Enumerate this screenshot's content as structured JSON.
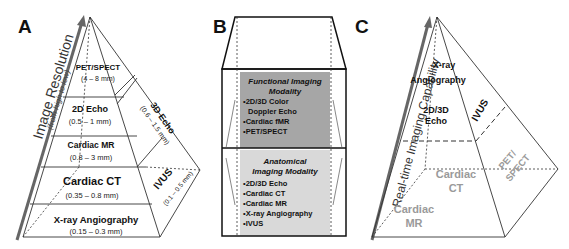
{
  "panels": {
    "a": {
      "letter": "A",
      "axis_label": "Image Resolution",
      "axis_sublabel": "(from high to low)",
      "tiers": [
        {
          "name": "PET/SPECT",
          "range": "(4 – 8 mm)"
        },
        {
          "name": "2D Echo",
          "range": "(0.5 – 1 mm)"
        },
        {
          "name": "Cardiac MR",
          "range": "(0.8 – 3 mm)"
        },
        {
          "name": "Cardiac CT",
          "range": "(0.35 – 0.8 mm)"
        },
        {
          "name": "X-ray Angiography",
          "range": "(0.15 – 0.3 mm)"
        }
      ],
      "side_tiers": [
        {
          "name": "3D Echo",
          "range": "(0.6 – 1.5 mm)"
        },
        {
          "name": "IVUS",
          "range": "(0.1 – 0.5 mm)"
        }
      ]
    },
    "b": {
      "letter": "B",
      "functional": {
        "title_line1": "Functional Imaging",
        "title_line2": "Modality",
        "items": [
          "•2D/3D Color",
          "Doppler Echo",
          "•Cardiac fMR",
          "•PET/SPECT"
        ]
      },
      "anatomical": {
        "title_line1": "Anatomical",
        "title_line2": "Imaging Modality",
        "items": [
          "•2D/3D Echo",
          "•Cardiac CT",
          "•Cardiac MR",
          "•X-ray Angiography",
          "•IVUS"
        ]
      }
    },
    "c": {
      "letter": "C",
      "axis_label": "Real-time Imaging Capability",
      "front_labels": {
        "xray_line1": "X-ray",
        "xray_line2": "Angiography",
        "echo_line1": "2D/3D",
        "echo_line2": "Echo",
        "ivus": "IVUS"
      },
      "gray_labels": {
        "ct_line1": "Cardiac",
        "ct_line2": "CT",
        "mr_line1": "Cardiac",
        "mr_line2": "MR",
        "pet_line1": "PET/",
        "pet_line2": "SPECT"
      }
    }
  },
  "colors": {
    "functional_fill": "#a6a6a6",
    "anatomical_fill": "#d9d9d9",
    "line": "#333333",
    "gray_text": "#9a9a9a"
  }
}
